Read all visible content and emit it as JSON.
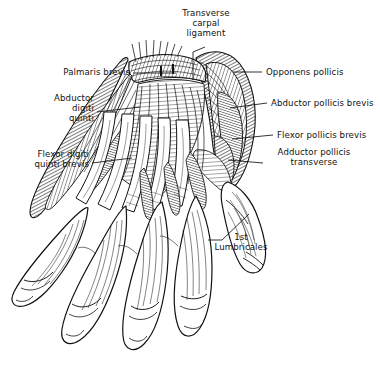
{
  "figure": {
    "type": "anatomical-line-illustration",
    "background_color": "#ffffff",
    "ink_color": "#111111",
    "labels": [
      {
        "id": "transverse-carpal-ligament",
        "text": "Transverse\ncarpal\nligament",
        "align": "center",
        "x": 193,
        "y": 8,
        "leader_from": [
          205,
          47
        ],
        "leader_to": [
          193,
          80
        ]
      },
      {
        "id": "palmaris-brevis",
        "text": "Palmaris brevis",
        "align": "right",
        "x": 34,
        "y": 68,
        "leader_from": [
          133,
          73
        ],
        "leader_to": [
          176,
          73
        ]
      },
      {
        "id": "opponens-pollicis",
        "text": "Opponens pollicis",
        "align": "left",
        "x": 266,
        "y": 68,
        "leader_from": [
          262,
          72
        ],
        "leader_to": [
          233,
          72
        ]
      },
      {
        "id": "abductor-digiti-quinti",
        "text": "Abductor\ndigiti\nquinti",
        "align": "right",
        "x": 34,
        "y": 95,
        "leader_from": [
          97,
          112
        ],
        "leader_to": [
          140,
          107
        ]
      },
      {
        "id": "abductor-pollicis-brevis",
        "text": "Abductor pollicis brevis",
        "align": "left",
        "x": 271,
        "y": 99,
        "leader_from": [
          267,
          103
        ],
        "leader_to": [
          230,
          108
        ]
      },
      {
        "id": "flexor-pollicis-brevis",
        "text": "Flexor pollicis brevis",
        "align": "left",
        "x": 277,
        "y": 131,
        "leader_from": [
          273,
          135
        ],
        "leader_to": [
          232,
          139
        ]
      },
      {
        "id": "flexor-digiti-quinti-brevis",
        "text": "Flexor digiti\nquinti brevis",
        "align": "right",
        "x": 13,
        "y": 150,
        "leader_from": [
          92,
          163
        ],
        "leader_to": [
          132,
          158
        ]
      },
      {
        "id": "adductor-pollicis-transverse",
        "text": "Adductor pollicis\ntransverse",
        "align": "left",
        "x": 267,
        "y": 148,
        "leader_from": [
          263,
          163
        ],
        "leader_to": [
          228,
          160
        ]
      },
      {
        "id": "first-lumbricales",
        "text": "1st\nLumbricales",
        "align": "center",
        "x": 215,
        "y": 233,
        "leader_from": [
          222,
          254
        ],
        "leader_to": [
          249,
          230
        ]
      }
    ],
    "structures": [
      "thenar-eminence",
      "hypothenar-eminence",
      "transverse-carpal-ligament-band",
      "palmar-aponeurosis-fibers",
      "flexor-tendons",
      "lumbrical-muscles",
      "thumb-digit",
      "index-digit",
      "middle-digit",
      "ring-digit",
      "little-digit"
    ]
  }
}
